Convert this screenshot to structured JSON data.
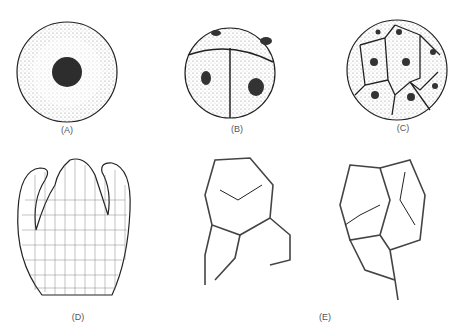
{
  "figure": {
    "panels": [
      {
        "id": "A",
        "label": "(A)",
        "description": "single cell with central nucleus"
      },
      {
        "id": "B",
        "label": "(B)",
        "description": "four-cell stage, each cell with nucleus"
      },
      {
        "id": "C",
        "label": "(C)",
        "description": "multicellular spherical cluster"
      },
      {
        "id": "D",
        "label": "(D)",
        "description": "shoot apex with leaf primordia, cellular tissue"
      },
      {
        "id": "E",
        "label": "(E)",
        "description": "cells with thickened walls and detached cytoplasm"
      }
    ],
    "colors": {
      "ink": "#222222",
      "background": "#ffffff",
      "label": "#555555"
    }
  }
}
